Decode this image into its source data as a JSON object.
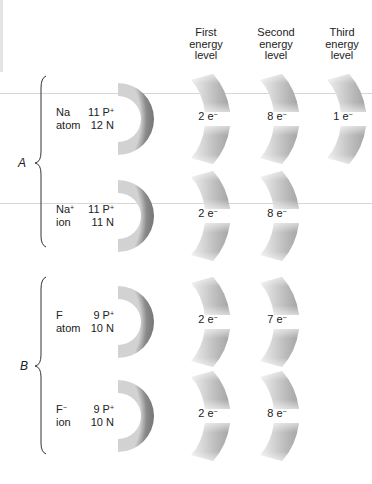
{
  "headers": {
    "first": [
      "First",
      "energy",
      "level"
    ],
    "second": [
      "Second",
      "energy",
      "level"
    ],
    "third": [
      "Third",
      "energy",
      "level"
    ]
  },
  "groups": [
    {
      "label": "A"
    },
    {
      "label": "B"
    }
  ],
  "rows": [
    {
      "species": "Na",
      "species_sup": "",
      "kind": "atom",
      "protons": "11 P",
      "proton_sup": "+",
      "neutrons": "12 N",
      "shells": [
        "2 e",
        "8 e",
        "1 e"
      ],
      "electron_sup": "−"
    },
    {
      "species": "Na",
      "species_sup": "+",
      "kind": "ion",
      "protons": "11 P",
      "proton_sup": "+",
      "neutrons": "11 N",
      "shells": [
        "2 e",
        "8 e"
      ],
      "electron_sup": "−"
    },
    {
      "species": "F",
      "species_sup": "",
      "kind": "atom",
      "protons": "9 P",
      "proton_sup": "+",
      "neutrons": "10 N",
      "shells": [
        "2 e",
        "7 e"
      ],
      "electron_sup": "−"
    },
    {
      "species": "F",
      "species_sup": "−",
      "kind": "ion",
      "protons": "9 P",
      "proton_sup": "+",
      "neutrons": "10 N",
      "shells": [
        "2 e",
        "8 e"
      ],
      "electron_sup": "−"
    }
  ],
  "colors": {
    "nucleus_dark": "#7a7a7a",
    "nucleus_light": "#cfcfcf",
    "shell_dark": "#a8a8a8",
    "shell_light": "#ececec",
    "brace": "#333333"
  }
}
